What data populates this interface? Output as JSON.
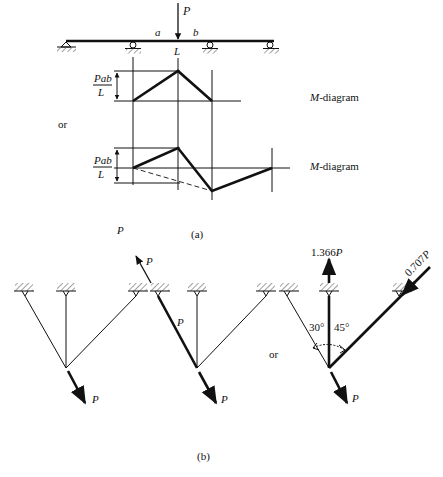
{
  "part_a": {
    "load_label": "P",
    "span_a_label": "a",
    "span_b_label": "b",
    "length_label": "L",
    "moment_numerator": "Pab",
    "moment_denominator": "L",
    "moment_numerator_2": "Pab",
    "moment_denominator_2": "L",
    "or_label": "or",
    "diagram1_label": "M-diagram",
    "diagram2_label": "M-diagram",
    "caption": "(a)"
  },
  "part_b": {
    "stray_load_label": "P",
    "truss1": {
      "load_label": "P"
    },
    "truss2": {
      "upper_force_label": "P",
      "member_force_label": "P",
      "load_label": "P"
    },
    "or_label": "or",
    "truss3": {
      "vertical_force_label": "1.366P",
      "inclined_force_label": "0.707P",
      "angle_left_label": "30°",
      "angle_right_label": "45°",
      "load_label": "P"
    },
    "caption": "(b)"
  }
}
